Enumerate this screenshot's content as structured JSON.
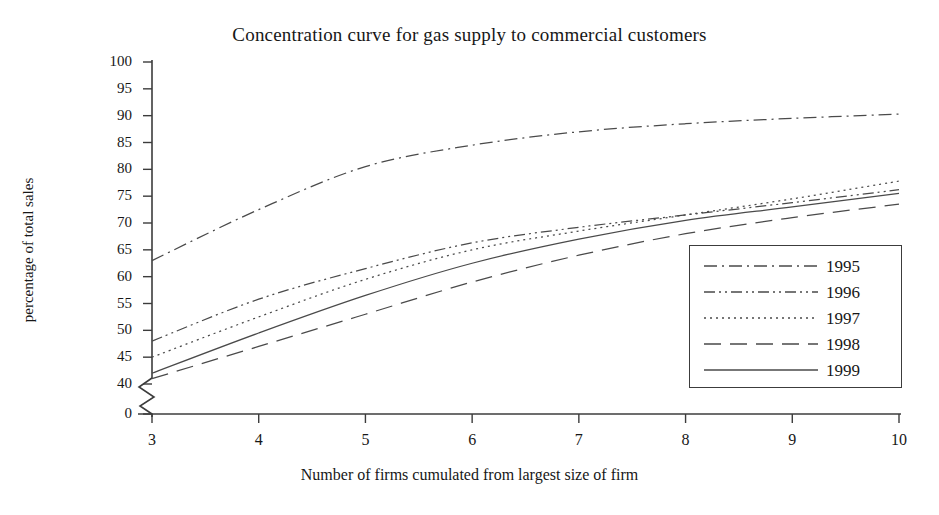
{
  "chart_data": {
    "type": "line",
    "title": "Concentration curve for gas supply to commercial customers",
    "xlabel": "Number of firms cumulated from largest size of firm",
    "ylabel": "percentage of total sales",
    "x": [
      3,
      4,
      5,
      6,
      7,
      8,
      9,
      10
    ],
    "xtick_labels": [
      "3",
      "4",
      "5",
      "6",
      "7",
      "8",
      "9",
      "10"
    ],
    "xlim": [
      3,
      10
    ],
    "ytick_labels": [
      "0",
      "40",
      "45",
      "50",
      "55",
      "60",
      "65",
      "70",
      "75",
      "80",
      "85",
      "90",
      "95",
      "100"
    ],
    "ylim": [
      40,
      100
    ],
    "y_axis_break": true,
    "y_break_note": "axis broken between 0 and 40",
    "grid": false,
    "legend_position": "lower right",
    "series": [
      {
        "name": "1995",
        "linestyle": "dash-dot",
        "values": [
          63.0,
          72.5,
          80.5,
          84.5,
          87.0,
          88.5,
          89.5,
          90.3
        ]
      },
      {
        "name": "1996",
        "linestyle": "dash-dot-dot",
        "values": [
          48.0,
          55.8,
          61.5,
          66.3,
          69.2,
          71.5,
          73.8,
          76.2
        ]
      },
      {
        "name": "1997",
        "linestyle": "dotted",
        "values": [
          45.0,
          52.5,
          59.5,
          65.0,
          68.5,
          71.5,
          74.5,
          77.8
        ]
      },
      {
        "name": "1998",
        "linestyle": "long-dash",
        "values": [
          41.0,
          47.0,
          53.0,
          59.0,
          64.0,
          68.0,
          71.0,
          73.5
        ]
      },
      {
        "name": "1999",
        "linestyle": "solid",
        "values": [
          42.0,
          49.5,
          56.5,
          62.5,
          67.0,
          70.5,
          73.0,
          75.5
        ]
      }
    ],
    "colors": {
      "axis": "#3c3c3c",
      "line": "#4a4a4a",
      "text": "#171717",
      "background": "#ffffff"
    }
  }
}
